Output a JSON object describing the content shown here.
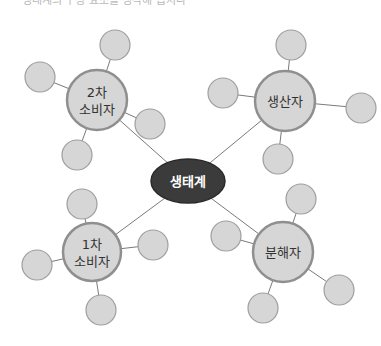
{
  "diagram": {
    "type": "concept-map",
    "colors": {
      "line": "#7a7a7a",
      "node_fill": "#d6d6d6",
      "node_stroke": "#8f8f8f",
      "satellite_stroke": "#9e9e9e",
      "center_fill": "#3b3b3b",
      "center_text": "#ffffff",
      "node_text": "#333333"
    },
    "top_text": "생태계의 구성 요소를 생각해 봅시다",
    "center": {
      "label": "생태계",
      "x": 188,
      "y": 181,
      "rx": 37,
      "ry": 22
    },
    "nodes": [
      {
        "id": "secondary-consumer",
        "label_line1": "2차",
        "label_line2": "소비자",
        "x": 97,
        "y": 100,
        "r": 30,
        "satellites": [
          {
            "x": 115,
            "y": 45
          },
          {
            "x": 40,
            "y": 77
          },
          {
            "x": 77,
            "y": 155
          },
          {
            "x": 150,
            "y": 124
          }
        ]
      },
      {
        "id": "producer",
        "label_line1": "생산자",
        "label_line2": "",
        "x": 285,
        "y": 101,
        "r": 30,
        "satellites": [
          {
            "x": 291,
            "y": 45
          },
          {
            "x": 223,
            "y": 93
          },
          {
            "x": 361,
            "y": 108
          },
          {
            "x": 278,
            "y": 159
          }
        ]
      },
      {
        "id": "primary-consumer",
        "label_line1": "1차",
        "label_line2": "소비자",
        "x": 92,
        "y": 252,
        "r": 29,
        "satellites": [
          {
            "x": 82,
            "y": 204
          },
          {
            "x": 37,
            "y": 265
          },
          {
            "x": 153,
            "y": 245
          },
          {
            "x": 101,
            "y": 310
          }
        ]
      },
      {
        "id": "decomposer",
        "label_line1": "분해자",
        "label_line2": "",
        "x": 283,
        "y": 252,
        "r": 30,
        "satellites": [
          {
            "x": 301,
            "y": 199
          },
          {
            "x": 226,
            "y": 236
          },
          {
            "x": 339,
            "y": 290
          },
          {
            "x": 263,
            "y": 308
          }
        ]
      }
    ],
    "satellite_r": 15
  }
}
